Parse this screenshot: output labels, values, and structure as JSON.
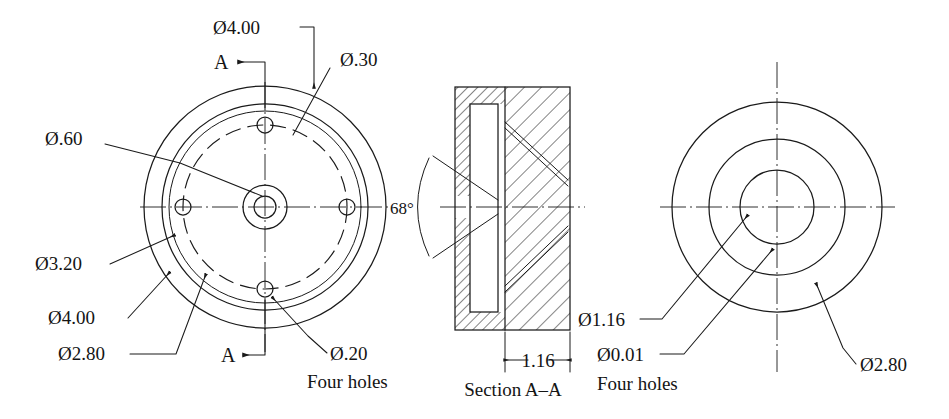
{
  "drawing": {
    "title": "Flanged hub machine part — multiview engineering drawing",
    "background_color": "#ffffff",
    "line_color": "#1a1a1a",
    "width": 949,
    "height": 419
  },
  "views": {
    "front": {
      "name": "Front view (left)",
      "section_mark_top": "A",
      "section_mark_bottom": "A",
      "labels": {
        "outer_dia": "Ø4.00",
        "bolt_circle_note": "Ø.30",
        "hub_bore": "Ø.60",
        "recess_dia": "Ø3.20",
        "flange_dia": "Ø4.00",
        "counterbore_dia": "Ø2.80",
        "hole_dia": "Ø.20",
        "hole_count": "Four holes"
      }
    },
    "section": {
      "name": "Section A–A (middle)",
      "caption": "Section A–A",
      "angle_label": "68°",
      "thickness_label": "1.16"
    },
    "right": {
      "name": "Right / auxiliary view",
      "labels": {
        "bore_dia": "Ø1.16",
        "tolerance_dia": "Ø0.01",
        "hole_count": "Four holes",
        "outer_dia": "Ø2.80"
      }
    }
  },
  "annotations": [
    {
      "id": "a1",
      "text": "Ø4.00",
      "view": "front",
      "kind": "diameter"
    },
    {
      "id": "a2",
      "text": "A",
      "view": "front",
      "kind": "section-letter"
    },
    {
      "id": "a3",
      "text": "Ø.30",
      "view": "front",
      "kind": "diameter"
    },
    {
      "id": "a4",
      "text": "Ø.60",
      "view": "front",
      "kind": "diameter"
    },
    {
      "id": "a5",
      "text": "Ø3.20",
      "view": "front",
      "kind": "diameter"
    },
    {
      "id": "a6",
      "text": "Ø4.00",
      "view": "front",
      "kind": "diameter"
    },
    {
      "id": "a7",
      "text": "Ø2.80",
      "view": "front",
      "kind": "diameter"
    },
    {
      "id": "a8",
      "text": "A",
      "view": "front",
      "kind": "section-letter"
    },
    {
      "id": "a9",
      "text": "Ø.20",
      "view": "front",
      "kind": "diameter"
    },
    {
      "id": "a10",
      "text": "Four holes",
      "view": "front",
      "kind": "note"
    },
    {
      "id": "a11",
      "text": "68°",
      "view": "section",
      "kind": "angle"
    },
    {
      "id": "a12",
      "text": "1.16",
      "view": "section",
      "kind": "linear"
    },
    {
      "id": "a13",
      "text": "Section A–A",
      "view": "section",
      "kind": "caption"
    },
    {
      "id": "a14",
      "text": "Ø1.16",
      "view": "right",
      "kind": "diameter"
    },
    {
      "id": "a15",
      "text": "Ø0.01",
      "view": "right",
      "kind": "diameter"
    },
    {
      "id": "a16",
      "text": "Four holes",
      "view": "right",
      "kind": "note"
    },
    {
      "id": "a17",
      "text": "Ø2.80",
      "view": "right",
      "kind": "diameter"
    }
  ]
}
